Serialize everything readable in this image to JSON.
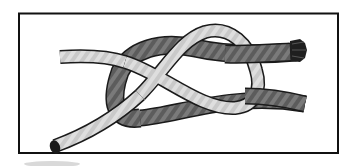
{
  "image": {
    "subject": "knot illustration",
    "description": "Line illustration of a knot formed by a light gray rope and a dark gray rope inside a black rectangular frame",
    "colors": {
      "frame": "#111111",
      "background": "#ffffff",
      "light_rope": "#c8c8c8",
      "light_rope_highlight": "#e6e6e6",
      "dark_rope": "#5a5a5a",
      "dark_rope_highlight": "#8a8a8a",
      "outline": "#1a1a1a",
      "shadow": "#d9d9d9"
    }
  }
}
